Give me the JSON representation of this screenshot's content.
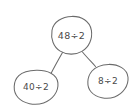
{
  "diagram": {
    "type": "number-bond",
    "background_color": "#ffffff",
    "stroke_color": "#6b6b6b",
    "text_color": "#4a4a4a",
    "style": "hand-drawn",
    "nodes": [
      {
        "id": "root",
        "role": "whole",
        "label": "48÷2",
        "cx": 71.5,
        "cy": 35.5,
        "rx": 20,
        "ry": 19
      },
      {
        "id": "part-left",
        "role": "part",
        "label": "40÷2",
        "cx": 36,
        "cy": 87,
        "rx": 22,
        "ry": 17
      },
      {
        "id": "part-right",
        "role": "part",
        "label": "8÷2",
        "cx": 108,
        "cy": 81.5,
        "rx": 20,
        "ry": 17
      }
    ],
    "edges": [
      {
        "id": "edge-left",
        "from": "root",
        "to": "part-left"
      },
      {
        "id": "edge-right",
        "from": "root",
        "to": "part-right"
      }
    ]
  }
}
